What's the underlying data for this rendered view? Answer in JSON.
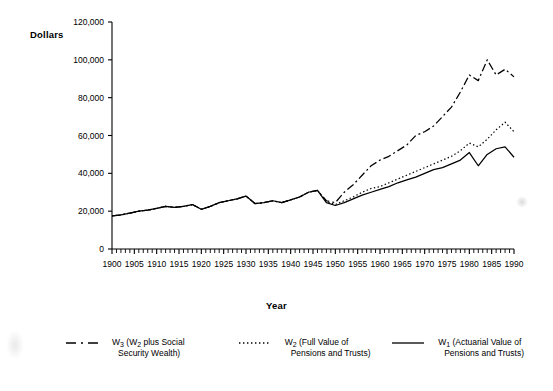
{
  "chart_data": {
    "type": "line",
    "title": "",
    "xlabel": "Year",
    "ylabel": "Dollars",
    "xlim": [
      1900,
      1990
    ],
    "ylim": [
      0,
      120000
    ],
    "ytick_labels": [
      "0",
      "20,000",
      "40,000",
      "60,000",
      "80,000",
      "100,000",
      "120,000"
    ],
    "ytick_values": [
      0,
      20000,
      40000,
      60000,
      80000,
      100000,
      120000
    ],
    "xtick_labels": [
      "1900",
      "1905",
      "1910",
      "1915",
      "1920",
      "1925",
      "1930",
      "1935",
      "1940",
      "1945",
      "1950",
      "1955",
      "1960",
      "1965",
      "1970",
      "1975",
      "1980",
      "1985",
      "1990"
    ],
    "xtick_values": [
      1900,
      1905,
      1910,
      1915,
      1920,
      1925,
      1930,
      1935,
      1940,
      1945,
      1950,
      1955,
      1960,
      1965,
      1970,
      1975,
      1980,
      1985,
      1990
    ],
    "grid": false,
    "legend_position": "bottom",
    "series": [
      {
        "name": "W3 (W2 plus Social Security Wealth)",
        "style": "dash-dot",
        "x": [
          1900,
          1902,
          1904,
          1906,
          1908,
          1910,
          1912,
          1914,
          1916,
          1918,
          1920,
          1922,
          1924,
          1926,
          1928,
          1930,
          1932,
          1934,
          1936,
          1938,
          1940,
          1942,
          1944,
          1946,
          1948,
          1950,
          1952,
          1954,
          1956,
          1958,
          1960,
          1962,
          1964,
          1966,
          1968,
          1970,
          1972,
          1974,
          1976,
          1978,
          1980,
          1982,
          1984,
          1986,
          1988,
          1990
        ],
        "values": [
          17500,
          18000,
          19000,
          20000,
          20500,
          21500,
          22500,
          22000,
          22500,
          23500,
          21000,
          22500,
          24500,
          25500,
          26500,
          28000,
          24000,
          24500,
          25500,
          24500,
          26000,
          27500,
          30000,
          31000,
          25500,
          24500,
          30000,
          34000,
          39000,
          44000,
          47000,
          49000,
          52000,
          55000,
          60000,
          62000,
          65000,
          70000,
          75000,
          83000,
          92000,
          89000,
          100000,
          92000,
          95000,
          91000
        ]
      },
      {
        "name": "W2 (Full Value of Pensions and Trusts)",
        "style": "dotted",
        "x": [
          1900,
          1902,
          1904,
          1906,
          1908,
          1910,
          1912,
          1914,
          1916,
          1918,
          1920,
          1922,
          1924,
          1926,
          1928,
          1930,
          1932,
          1934,
          1936,
          1938,
          1940,
          1942,
          1944,
          1946,
          1948,
          1950,
          1952,
          1954,
          1956,
          1958,
          1960,
          1962,
          1964,
          1966,
          1968,
          1970,
          1972,
          1974,
          1976,
          1978,
          1980,
          1982,
          1984,
          1986,
          1988,
          1990
        ],
        "values": [
          17500,
          18000,
          19000,
          20000,
          20500,
          21500,
          22500,
          22000,
          22500,
          23500,
          21000,
          22500,
          24500,
          25500,
          26500,
          28000,
          24000,
          24500,
          25500,
          24500,
          26000,
          27500,
          30000,
          31000,
          25000,
          23500,
          25500,
          27500,
          30000,
          32000,
          33000,
          35000,
          37000,
          39000,
          41000,
          43000,
          45000,
          47000,
          49000,
          52000,
          56000,
          54000,
          58000,
          63000,
          67000,
          62000
        ]
      },
      {
        "name": "W1 (Actuarial Value of Pensions and Trusts)",
        "style": "solid",
        "x": [
          1900,
          1902,
          1904,
          1906,
          1908,
          1910,
          1912,
          1914,
          1916,
          1918,
          1920,
          1922,
          1924,
          1926,
          1928,
          1930,
          1932,
          1934,
          1936,
          1938,
          1940,
          1942,
          1944,
          1946,
          1948,
          1950,
          1952,
          1954,
          1956,
          1958,
          1960,
          1962,
          1964,
          1966,
          1968,
          1970,
          1972,
          1974,
          1976,
          1978,
          1980,
          1982,
          1984,
          1986,
          1988,
          1990
        ],
        "values": [
          17500,
          18000,
          19000,
          20000,
          20500,
          21500,
          22500,
          22000,
          22500,
          23500,
          21000,
          22500,
          24500,
          25500,
          26500,
          28000,
          24000,
          24500,
          25500,
          24500,
          26000,
          27500,
          30000,
          31000,
          24500,
          23000,
          24500,
          26500,
          28500,
          30000,
          31500,
          33000,
          35000,
          36500,
          38000,
          40000,
          42000,
          43000,
          45000,
          47000,
          51000,
          44000,
          50000,
          53000,
          54000,
          48500
        ]
      }
    ]
  },
  "axis": {
    "ylabel": "Dollars",
    "xlabel": "Year"
  },
  "legend": {
    "items": [
      {
        "style": "dash-dot",
        "line1": "W",
        "sub1": "3",
        "rest1": " (W",
        "sub2": "2",
        "rest2": " plus Social",
        "line2": "Security Wealth)"
      },
      {
        "style": "dotted",
        "line1": "W",
        "sub1": "2",
        "rest1": " (Full Value of",
        "sub2": "",
        "rest2": "",
        "line2": "Pensions and Trusts)"
      },
      {
        "style": "solid",
        "line1": "W",
        "sub1": "1",
        "rest1": " (Actuarial Value of",
        "sub2": "",
        "rest2": "",
        "line2": "Pensions and Trusts)"
      }
    ]
  }
}
